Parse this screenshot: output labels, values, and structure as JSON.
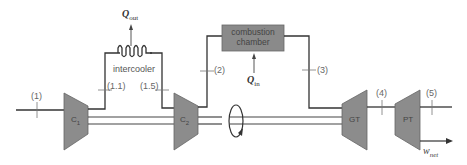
{
  "diagram": {
    "components": {
      "c1": {
        "label": "C",
        "sub": "1"
      },
      "c2": {
        "label": "C",
        "sub": "2"
      },
      "gt": {
        "label": "GT"
      },
      "pt": {
        "label": "PT"
      },
      "intercooler": {
        "label": "intercooler"
      },
      "combustion_chamber": {
        "line1": "combustion",
        "line2": "chamber"
      }
    },
    "heat_flows": {
      "q_out": {
        "symbol": "Q",
        "sub": "out"
      },
      "q_in": {
        "symbol": "Q",
        "sub": "in"
      }
    },
    "work": {
      "symbol": "w",
      "sub": "net"
    },
    "states": [
      "(1)",
      "(1.1)",
      "(1.5)",
      "(2)",
      "(3)",
      "(4)",
      "(5)"
    ],
    "colors": {
      "component_fill": "#8c8c8c",
      "line": "#333333",
      "chamber_fill": "#8a8a8a"
    }
  }
}
